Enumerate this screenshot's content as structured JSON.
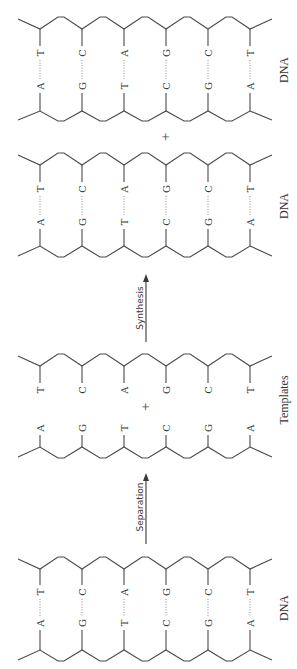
{
  "figure": {
    "orientation": "rotated-90-ccw",
    "colors": {
      "line": "#4a4a4a",
      "text": "#333333",
      "hbond": "#8a8a8a",
      "background": "#ffffff"
    },
    "columns_x": [
      40,
      82,
      124,
      166,
      208,
      250
    ],
    "blocks": [
      {
        "id": "dna-replicated-1",
        "label": "DNA",
        "label_pos": [
          284,
          70
        ],
        "paired": true,
        "top_strand": [
          "T",
          "C",
          "A",
          "G",
          "C",
          "T"
        ],
        "bottom_strand": [
          "A",
          "G",
          "T",
          "C",
          "G",
          "A"
        ],
        "top_node_y": 29,
        "top_peak_y": 17,
        "bottom_node_y": 111,
        "bottom_trough_y": 121,
        "top_letter_y": 53,
        "bottom_letter_y": 86
      },
      {
        "id": "dna-replicated-2",
        "label": "DNA",
        "label_pos": [
          284,
          206
        ],
        "paired": true,
        "top_strand": [
          "T",
          "C",
          "A",
          "G",
          "C",
          "T"
        ],
        "bottom_strand": [
          "A",
          "G",
          "T",
          "C",
          "G",
          "A"
        ],
        "top_node_y": 165,
        "top_peak_y": 153,
        "bottom_node_y": 246,
        "bottom_trough_y": 257,
        "top_letter_y": 189,
        "bottom_letter_y": 222
      },
      {
        "id": "templates",
        "label": "Templates",
        "label_pos": [
          284,
          400
        ],
        "paired": false,
        "top_strand": [
          "T",
          "C",
          "A",
          "G",
          "C",
          "T"
        ],
        "bottom_strand": [
          "A",
          "G",
          "T",
          "C",
          "G",
          "A"
        ],
        "top_node_y": 366,
        "top_peak_y": 354,
        "bottom_node_y": 447,
        "bottom_trough_y": 458,
        "top_letter_y": 390,
        "bottom_letter_y": 428
      },
      {
        "id": "dna-original",
        "label": "DNA",
        "label_pos": [
          284,
          608
        ],
        "paired": true,
        "top_strand": [
          "T",
          "C",
          "A",
          "G",
          "C",
          "T"
        ],
        "bottom_strand": [
          "A",
          "G",
          "T",
          "C",
          "G",
          "A"
        ],
        "top_node_y": 569,
        "top_peak_y": 557,
        "bottom_node_y": 650,
        "bottom_trough_y": 661,
        "top_letter_y": 592,
        "bottom_letter_y": 623
      }
    ],
    "plus_signs": [
      {
        "id": "plus-between-dna",
        "text": "+",
        "pos": [
          165,
          137
        ]
      },
      {
        "id": "plus-between-templates",
        "text": "+",
        "pos": [
          145,
          407
        ]
      }
    ],
    "arrows": [
      {
        "id": "synthesis-arrow",
        "label": "Synthesis",
        "x": 146,
        "y_from": 342,
        "y_to": 274,
        "label_x": 140,
        "label_y": 308
      },
      {
        "id": "separation-arrow",
        "label": "Separation",
        "x": 146,
        "y_from": 544,
        "y_to": 473,
        "label_x": 140,
        "label_y": 507
      }
    ]
  }
}
